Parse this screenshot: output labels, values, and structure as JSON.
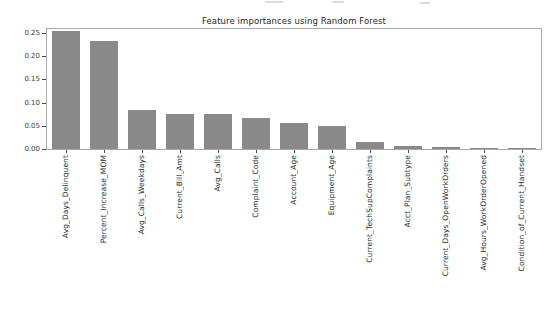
{
  "chart_data": {
    "type": "bar",
    "title": "Feature importances using Random Forest",
    "categories": [
      "Avg_Days_Delinquent",
      "Percent_Increase_MOM",
      "Avg_Calls_Weekdays",
      "Current_Bill_Amt",
      "Avg_Calls",
      "Complaint_Code",
      "Account_Age",
      "Equipment_Age",
      "Current_TechSupComplaints",
      "Acct_Plan_Subtype",
      "Current_Days_OpenWorkOrders",
      "Avg_Hours_WorkOrderOpened",
      "Condition_of_Current_Handset"
    ],
    "values": [
      0.2545,
      0.2335,
      0.0835,
      0.076,
      0.075,
      0.066,
      0.055,
      0.0505,
      0.016,
      0.0075,
      0.005,
      0.003,
      0.001
    ],
    "xlabel": "",
    "ylabel": "",
    "ylim": [
      0,
      0.2585
    ],
    "yticks": [
      0.0,
      0.05,
      0.1,
      0.15,
      0.2,
      0.25
    ],
    "ytick_labels": [
      "0.00",
      "0.05",
      "0.10",
      "0.15",
      "0.20",
      "0.25"
    ],
    "grid": false,
    "legend": null,
    "colors": {
      "bar": "#898989",
      "spine": "#a9a9a9",
      "tick": "#4a4a4a",
      "title_text": "#262626",
      "label_text": "#2b2b2b",
      "background": "#ffffff"
    }
  }
}
